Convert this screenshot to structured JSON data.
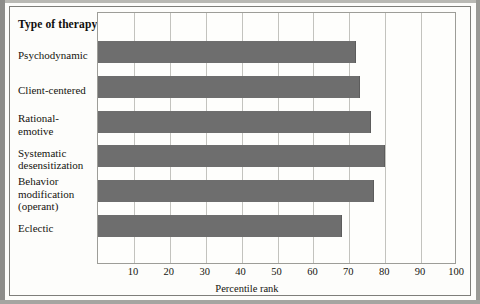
{
  "figure": {
    "column_header": "Type of\ntherapy",
    "axis_title": "Percentile rank"
  },
  "chart_data": {
    "type": "bar",
    "orientation": "horizontal",
    "title": "",
    "xlabel": "Percentile rank",
    "ylabel": "Type of therapy",
    "categories": [
      "Psychodynamic",
      "Client-centered",
      "Rational-\nemotive",
      "Systematic\ndesensitization",
      "Behavior\nmodification\n(operant)",
      "Eclectic"
    ],
    "values": [
      72,
      73,
      76,
      80,
      77,
      68
    ],
    "xlim": [
      0,
      100
    ],
    "xticks": [
      10,
      20,
      30,
      40,
      50,
      60,
      70,
      80,
      90,
      100
    ],
    "grid": true,
    "legend": "none",
    "bar_color": "#6e6e6e",
    "plot_background": "#fefefc"
  }
}
